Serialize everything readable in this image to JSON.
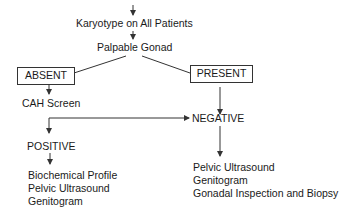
{
  "diagram": {
    "nodes": {
      "karyotype": "Karyotype on All Patients",
      "palpable": "Palpable Gonad",
      "absent": "ABSENT",
      "present": "PRESENT",
      "cah": "CAH Screen",
      "negative": "NEGATIVE",
      "positive": "POSITIVE"
    },
    "positive_list": [
      "Biochemical Profile",
      "Pelvic Ultrasound",
      "Genitogram"
    ],
    "negative_list": [
      "Pelvic Ultrasound",
      "Genitogram",
      "Gonadal Inspection and Biopsy"
    ],
    "line_color": "#333333"
  }
}
